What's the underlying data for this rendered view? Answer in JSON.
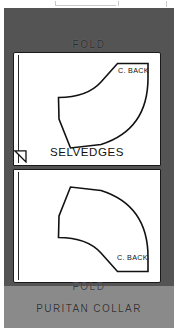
{
  "figure": {
    "title": "PURITAN  COLLAR",
    "fold_top_label": "FOLD",
    "fold_bottom_label": "FOLD",
    "selvedges_label": "SELVEDGES",
    "center_back_label_top": "C. BACK",
    "center_back_label_bottom": "C. BACK",
    "colors": {
      "fabric_field": "#545454",
      "caption_band": "#8a8a8a",
      "pattern_paper": "#ffffff",
      "ink": "#111111"
    }
  },
  "panels": [
    {
      "name": "upper-fabric-panel",
      "fold_edge": "left",
      "piece_name": "C. BACK"
    },
    {
      "name": "lower-fabric-panel",
      "fold_edge": "left",
      "piece_name": "C. BACK"
    }
  ],
  "notches": [
    {
      "name": "selvedge-notch-upper"
    },
    {
      "name": "selvedge-notch-lower"
    }
  ]
}
